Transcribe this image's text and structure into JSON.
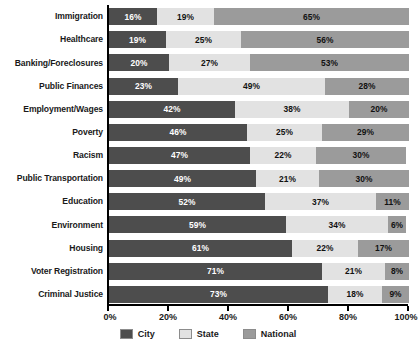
{
  "chart_data": {
    "type": "bar",
    "subtype": "stacked-horizontal-bar",
    "title": "",
    "xlabel": "",
    "ylabel": "",
    "xlim": [
      0,
      100
    ],
    "grid": false,
    "legend_position": "bottom",
    "unit": "%",
    "categories": [
      "Immigration",
      "Healthcare",
      "Banking/Foreclosures",
      "Public Finances",
      "Employment/Wages",
      "Poverty",
      "Racism",
      "Public Transportation",
      "Education",
      "Environment",
      "Housing",
      "Voter Registration",
      "Criminal Justice"
    ],
    "series": [
      {
        "name": "City",
        "color": "#4d4d4d",
        "values": [
          16,
          19,
          20,
          23,
          42,
          46,
          47,
          49,
          52,
          59,
          61,
          71,
          73
        ],
        "labels": [
          "16%",
          "19%",
          "20%",
          "23%",
          "42%",
          "46%",
          "47%",
          "49%",
          "52%",
          "59%",
          "61%",
          "71%",
          "73%"
        ]
      },
      {
        "name": "State",
        "color": "#e2e2e2",
        "values": [
          19,
          25,
          27,
          49,
          38,
          25,
          22,
          21,
          37,
          34,
          22,
          21,
          18
        ],
        "labels": [
          "19%",
          "25%",
          "27%",
          "49%",
          "38%",
          "25%",
          "22%",
          "21%",
          "37%",
          "34%",
          "22%",
          "21%",
          "18%"
        ]
      },
      {
        "name": "National",
        "color": "#9b9b9b",
        "values": [
          65,
          56,
          53,
          28,
          20,
          29,
          30,
          30,
          11,
          6,
          17,
          8,
          9
        ],
        "labels": [
          "65%",
          "56%",
          "53%",
          "28%",
          "20%",
          "29%",
          "30%",
          "30%",
          "11%",
          "6%",
          "17%",
          "8%",
          "9%"
        ]
      }
    ],
    "xticks": [
      0,
      20,
      40,
      60,
      80,
      100
    ],
    "xtick_labels": [
      "0%",
      "20%",
      "40%",
      "60%",
      "80%",
      "100%"
    ]
  },
  "legend": {
    "items": [
      {
        "label": "City",
        "color": "#4d4d4d"
      },
      {
        "label": "State",
        "color": "#e2e2e2"
      },
      {
        "label": "National",
        "color": "#9b9b9b"
      }
    ]
  }
}
